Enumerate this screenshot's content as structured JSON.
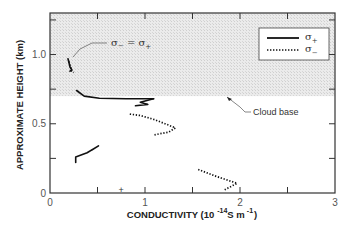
{
  "chart_data": {
    "type": "line",
    "title": "",
    "xlabel": "CONDUCTIVITY (10^-14 S m^-1)",
    "xlabel_parts": {
      "main": "CONDUCTIVITY (10",
      "exp1": "-14",
      "unit": "S m",
      "exp2": "-1",
      "close": ")"
    },
    "ylabel": "APPROXIMATE HEIGHT (km)",
    "xlim": [
      0,
      3
    ],
    "ylim": [
      0,
      1.3
    ],
    "x_ticks": [
      0,
      0.5,
      1,
      1.5,
      2,
      2.5,
      3
    ],
    "x_tick_labels": [
      "0",
      "",
      "1",
      "",
      "2",
      "",
      "3"
    ],
    "y_ticks": [
      0,
      0.25,
      0.5,
      0.75,
      1.0,
      1.25
    ],
    "y_tick_labels": [
      "0",
      "",
      "0.5",
      "",
      "1.0",
      ""
    ],
    "grid": false,
    "legend_position": "upper right",
    "shaded_region": {
      "label": "Cloud",
      "y_from": 0.7,
      "y_to": 1.3,
      "color": "#e4e4e4"
    },
    "series": [
      {
        "name": "σ+",
        "style": "solid",
        "color": "#111111",
        "segments": [
          [
            [
              0.19,
              0.97
            ],
            [
              0.2,
              0.94
            ],
            [
              0.21,
              0.91
            ],
            [
              0.23,
              0.89
            ],
            [
              0.21,
              0.88
            ]
          ],
          [
            [
              0.28,
              0.74
            ],
            [
              0.36,
              0.7
            ],
            [
              0.52,
              0.685
            ],
            [
              0.8,
              0.68
            ],
            [
              1.09,
              0.68
            ]
          ],
          [
            [
              1.09,
              0.68
            ],
            [
              0.95,
              0.655
            ],
            [
              1.03,
              0.64
            ],
            [
              0.9,
              0.63
            ]
          ],
          [
            [
              0.27,
              0.22
            ],
            [
              0.27,
              0.26
            ],
            [
              0.39,
              0.29
            ],
            [
              0.51,
              0.34
            ],
            [
              0.44,
              0.31
            ]
          ]
        ]
      },
      {
        "name": "σ−",
        "style": "dotted",
        "color": "#111111",
        "segments": [
          [
            [
              0.2,
              0.95
            ],
            [
              0.21,
              0.92
            ],
            [
              0.23,
              0.88
            ],
            [
              0.25,
              0.87
            ]
          ],
          [
            [
              0.84,
              0.57
            ],
            [
              0.95,
              0.56
            ],
            [
              1.1,
              0.53
            ],
            [
              1.25,
              0.49
            ],
            [
              1.32,
              0.47
            ],
            [
              1.25,
              0.44
            ],
            [
              1.1,
              0.42
            ]
          ],
          [
            [
              1.56,
              0.17
            ],
            [
              1.75,
              0.12
            ],
            [
              1.97,
              0.07
            ],
            [
              1.83,
              0.02
            ]
          ]
        ]
      }
    ],
    "markers": [
      {
        "symbol": "+",
        "x": 0.75,
        "y": 0.03
      }
    ],
    "annotations": [
      {
        "text": "σ− = σ+",
        "points_to": [
          0.21,
          0.96
        ]
      },
      {
        "text": "Cloud base",
        "points_to": [
          1.9,
          0.69
        ]
      }
    ]
  },
  "legend": {
    "items": [
      {
        "label": "σ",
        "sub": "+",
        "style": "solid"
      },
      {
        "label": "σ",
        "sub": "−",
        "style": "dotted"
      }
    ]
  },
  "annotations": {
    "equal_label": "σ",
    "equal_sub1": "−",
    "equal_mid": " = σ",
    "equal_sub2": "+",
    "cloud_base": "Cloud base"
  },
  "marker_symbol": "+"
}
